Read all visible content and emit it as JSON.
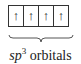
{
  "diagram": {
    "orbitals": [
      {
        "electron": "↑"
      },
      {
        "electron": "↑"
      },
      {
        "electron": "↑"
      },
      {
        "electron": "↑"
      }
    ],
    "label": {
      "hybrid": "sp",
      "superscript": "3",
      "suffix": " orbitals"
    }
  }
}
